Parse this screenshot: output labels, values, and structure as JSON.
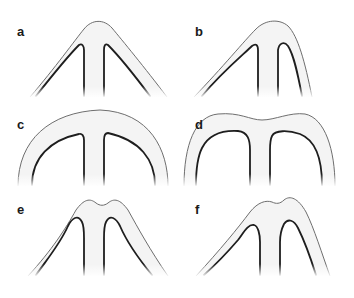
{
  "figure": {
    "panels": [
      {
        "label": "a",
        "description": "symmetric pointed arch with central stem"
      },
      {
        "label": "b",
        "description": "asymmetric arch, right limb steeper, central stem"
      },
      {
        "label": "c",
        "description": "broad rounded dome with central stem"
      },
      {
        "label": "d",
        "description": "flattened top with slight central dip, central stem"
      },
      {
        "label": "e",
        "description": "arch with central notch at apex, symmetric"
      },
      {
        "label": "f",
        "description": "arch with notch at apex, asymmetric"
      }
    ]
  },
  "colors": {
    "background": "#ffffff",
    "shape_fill": "#f4f4f4",
    "outer_edge": "#6e6e6e",
    "inner_edge": "#1e1e1e",
    "label": "#1a1a1a"
  }
}
